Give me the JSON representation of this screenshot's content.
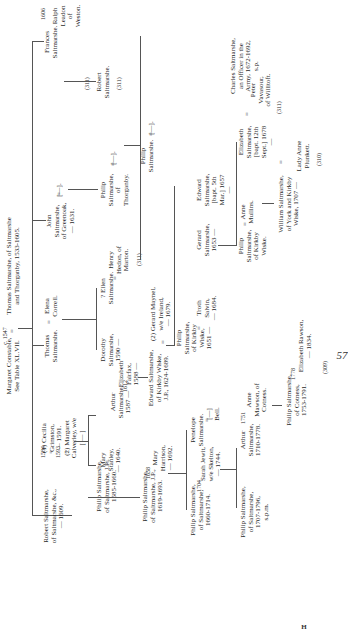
{
  "page": {
    "folio": "57",
    "signature": "H"
  },
  "root": {
    "left": "Margaret Constable,\nSee Table XL.VII.",
    "marriage_year": "c. 1547",
    "right": "Thomas Saltmarshe, of Saltmarshe\nand Thorganby, 1533-1605."
  },
  "generation1": [
    {
      "name": "Robert Saltmarshe,\nof Saltmarshe, &c.,\n— 1609.",
      "spouse_marks": "1584\n=\n1593\n=",
      "spouses": "(1) Cecilia\nGrimston,\n— 1591.\n(2) Margaret\nCalverley, w/e\n[ — ]"
    },
    {
      "name": "Thomas\nSaltmarshe.",
      "spouse": "Elena\nCorrell."
    },
    {
      "name": "John\nSaltmarshe,\nof Greenoak,\n— 1631.",
      "spouse": "[—]."
    },
    {
      "name": "Frances\nSaltmarshe.",
      "marriage_year": "1606",
      "spouse": "Ralph\nLeadon\nof\nWeston.",
      "ref": "(311)"
    }
  ],
  "generation2": [
    {
      "name": "Philip Saltmarshe,\nof Saltmarshe, J.P.,\n1585-1660.",
      "spouse": "Mary\nStanley,\n— 1640."
    },
    {
      "name": "Arthur\nSaltmarshe,\n1587 —",
      "marriage_year": "1612",
      "spouse": "Elizabeth\nFairfax,\n1588 —"
    },
    {
      "name": "Dorothy\nSaltmarshe,\n1590 —"
    },
    {
      "name": "? Ellen\nSaltmarshe.",
      "spouse": "Henry\nHedon, of\nMarton.",
      "ref": "(311)"
    },
    {
      "name": "Philip\nSaltmarshe,\nof\nThorganby.",
      "spouse": "[—]."
    },
    {
      "name": "Robert\nSaltmarshe.",
      "ref": "(311)"
    }
  ],
  "generation3": [
    {
      "name": "Philip Saltmarshe,\nof Saltmarshe, J.P.,\n1619-1693.",
      "marriage_year": "1658",
      "spouse": "Mary\nHarrison,\n— 1692."
    },
    {
      "name": "Edward Saltmarshe,\nof Kirkby Wiske,\nJ.P., 1624-1689.",
      "spouse": "(2) Gerard Maynel,\nw/e Ireland,\n— 1679."
    },
    {
      "name": "Philip\nSaltmarshe,\nof Kirkby\nWiske,\n1651 —",
      "spouse": "Troth\nSalvin,\n— 1684."
    },
    {
      "name": "Gerard\nSaltmarshe,\n1653 —"
    },
    {
      "name": "Edward\nSaltmarshe,\n[bapt. 5th\nMar.] 1657\n—"
    },
    {
      "name": "Philip\nSaltmarshe.",
      "spouse": "[—]."
    },
    {
      "name": "Charles Saltmarshe,\nan Officer in the\nArmy, 1672-1692,\ns.p."
    }
  ],
  "generation4": [
    {
      "name": "Philip Saltmarshe,\nof Saltmarshe,\n1660-1714.",
      "marriage_year": "1704",
      "spouse": "Sarah Jewit,\nw/e Skelton,\n— 1744."
    },
    {
      "name": "Penelope\nSaltmarshe.",
      "spouse": "[—]\nBell."
    },
    {
      "name": "Philip\nSaltmarshe,\nof Kirkby\nWiske.",
      "spouse": "Anne\nMullins."
    },
    {
      "name": "Elizabeth\nSaltmarshe,\n[bapt. 12th\nSept.] 1678\n—",
      "spouse": "Peter\nVavasour,\nof Willitoft.",
      "ref": "(311)"
    }
  ],
  "generation5": [
    {
      "name": "Philip Saltmarshe,\nof Saltmarshe,\n1707-1796,\ns.p.m."
    },
    {
      "name": "Arthur\nSaltmarshe,\n1710-1778.",
      "marriage_year": "1751",
      "spouse": "Anne\nMawson, of\nCotness."
    },
    {
      "name": "William Saltmarshe,\nof York and Kirkby\nWiske, 1707 —",
      "spouse": "Lady Anne\nPlunkett.",
      "ref": "(310)"
    }
  ],
  "generation6": [
    {
      "name": "Philip Saltmarshe,\nof Cotness,\n1753-1791.",
      "marriage_year": "1778",
      "spouse": "Elizabeth Rawson,\n— 1834.",
      "ref": "(309)"
    }
  ]
}
